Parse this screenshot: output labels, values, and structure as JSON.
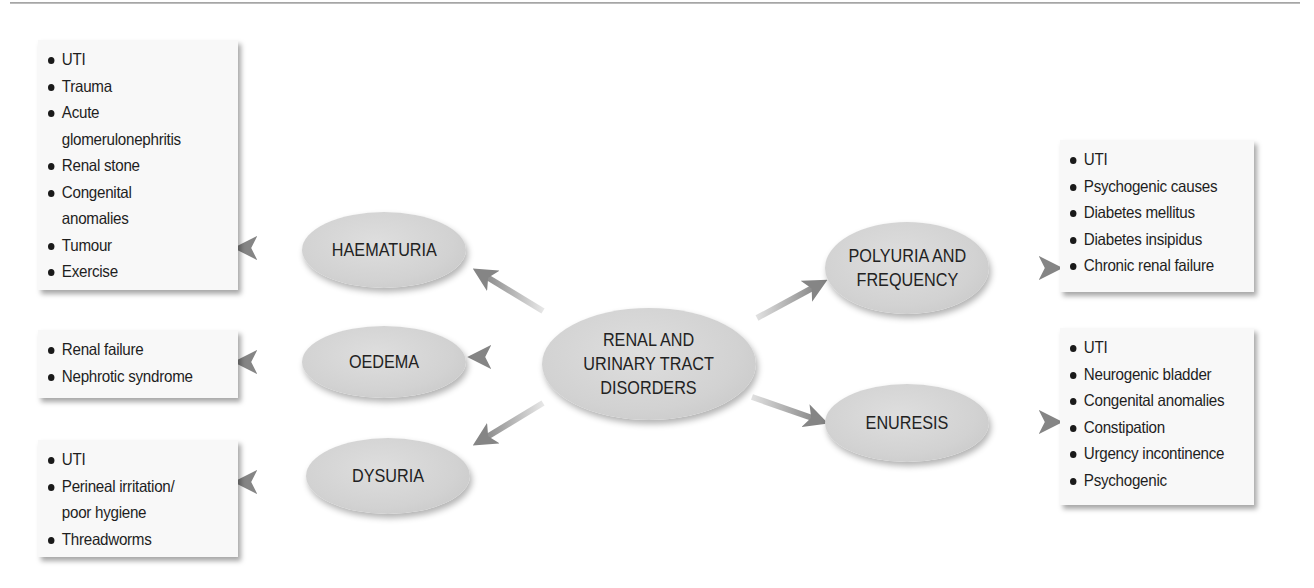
{
  "diagram": {
    "title": "RENAL AND URINARY TRACT DISORDERS",
    "center": {
      "label": "RENAL AND\nURINARY TRACT\nDISORDERS"
    },
    "branches": [
      {
        "id": "haematuria",
        "label": "HAEMATURIA",
        "side": "left",
        "causes": [
          "UTI",
          "Trauma",
          "Acute glomerulonephritis",
          "Renal stone",
          "Congenital anomalies",
          "Tumour",
          "Exercise"
        ],
        "causes_display": [
          "UTI",
          "Trauma",
          "Acute",
          "glomerulonephritis",
          "Renal stone",
          "Congenital",
          "anomalies",
          "Tumour",
          "Exercise"
        ]
      },
      {
        "id": "oedema",
        "label": "OEDEMA",
        "side": "left",
        "causes": [
          "Renal failure",
          "Nephrotic syndrome"
        ]
      },
      {
        "id": "dysuria",
        "label": "DYSURIA",
        "side": "left",
        "causes": [
          "UTI",
          "Perineal irritation/ poor hygiene",
          "Threadworms"
        ],
        "causes_display": [
          "UTI",
          "Perineal irritation/",
          "poor hygiene",
          "Threadworms"
        ]
      },
      {
        "id": "polyuria",
        "label": "POLYURIA AND\nFREQUENCY",
        "side": "right",
        "causes": [
          "UTI",
          "Psychogenic causes",
          "Diabetes mellitus",
          "Diabetes insipidus",
          "Chronic renal failure"
        ]
      },
      {
        "id": "enuresis",
        "label": "ENURESIS",
        "side": "right",
        "causes": [
          "UTI",
          "Neurogenic bladder",
          "Congenital anomalies",
          "Constipation",
          "Urgency incontinence",
          "Psychogenic"
        ]
      }
    ],
    "colors": {
      "node_fill": "#d4d4d4",
      "box_fill": "#f8f8f8",
      "arrow": "#8a8a8a",
      "text": "#1e1e1e"
    }
  }
}
